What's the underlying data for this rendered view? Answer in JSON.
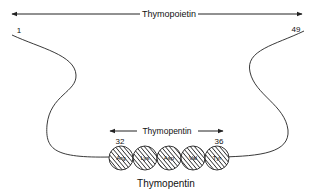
{
  "diagram": {
    "top_arrow": {
      "label": "Thymopoietin",
      "start_residue": "1",
      "end_residue": "49"
    },
    "inner_arrow": {
      "label": "Thymopentin",
      "start_residue": "32",
      "end_residue": "36"
    },
    "residues": [
      {
        "label": "Arg"
      },
      {
        "label": "Lys"
      },
      {
        "label": "Asp"
      },
      {
        "label": "Val"
      },
      {
        "label": "Tyr"
      }
    ],
    "caption": "Thymopentin",
    "colors": {
      "line": "#222222",
      "background": "#ffffff"
    }
  }
}
